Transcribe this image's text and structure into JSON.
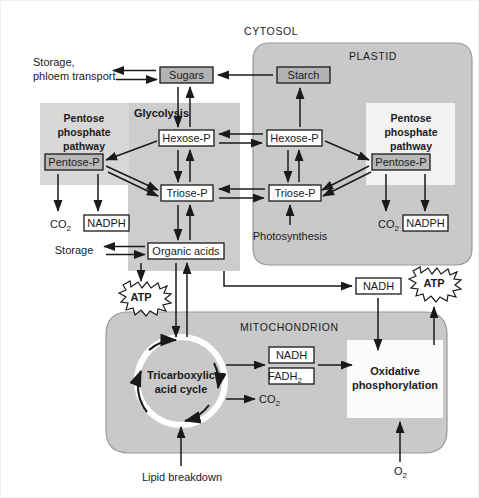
{
  "figure": {
    "compartments": {
      "cytosol_label": "CYTOSOL",
      "plastid_label": "PLASTID",
      "mitochondrion_label": "MITOCHONDRION"
    },
    "pathway_labels": {
      "glycolysis": "Glycolysis",
      "pentose_phosphate_cytosol": "Pentose\nphosphate\npathway",
      "pentose_phosphate_plastid": "Pentose\nphosphate\npathway",
      "pentose_line1": "Pentose",
      "pentose_line2": "phosphate",
      "pentose_line3": "pathway",
      "photosynthesis": "Photosynthesis",
      "tricarboxylic_line1": "Tricarboxylic",
      "tricarboxylic_line2": "acid cycle",
      "oxidative_line1": "Oxidative",
      "oxidative_line2": "phosphorylation",
      "lipid_breakdown": "Lipid breakdown"
    },
    "metabolites": {
      "sugars": "Sugars",
      "starch": "Starch",
      "hexose_p_cytosol": "Hexose-P",
      "hexose_p_plastid": "Hexose-P",
      "triose_p_cytosol": "Triose-P",
      "triose_p_plastid": "Triose-P",
      "pentose_p_cytosol": "Pentose-P",
      "pentose_p_plastid": "Pentose-P",
      "organic_acids": "Organic acids",
      "nadph_cytosol": "NADPH",
      "nadph_plastid": "NADPH",
      "nadh_cytosol": "NADH",
      "nadh_mitochondrion": "NADH",
      "fadh2": "FADH",
      "fadh2_sub": "2",
      "co2_cytosol": "CO",
      "co2_cytosol_sub": "2",
      "co2_plastid": "CO",
      "co2_plastid_sub": "2",
      "co2_tca": "CO",
      "co2_tca_sub": "2",
      "o2": "O",
      "o2_sub": "2",
      "atp_glycolysis": "ATP",
      "atp_oxphos": "ATP"
    },
    "transport_labels": {
      "storage_phloem_line1": "Storage,",
      "storage_phloem_line2": "phloem transport",
      "storage": "Storage"
    },
    "colors": {
      "background": "#ffffff",
      "compartment_fill": "#c9c9c9",
      "compartment_stroke": "#8c8c8c",
      "panel_fill": "#d6d6d6",
      "panel_white": "#ffffff",
      "box_fill_white": "#ffffff",
      "box_fill_grey": "#b3b3b3",
      "stroke": "#1a1a1a",
      "text": "#1a1a1a",
      "tca_fill": "#c9c9c9",
      "border": "#efefef"
    }
  }
}
